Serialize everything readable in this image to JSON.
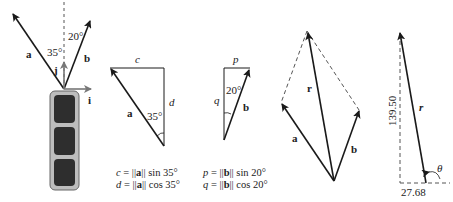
{
  "figure1": {
    "vector_a": "a",
    "vector_b": "b",
    "unit_i": "i",
    "unit_j": "j",
    "angle_a": "35°",
    "angle_b": "20°"
  },
  "figure2": {
    "side_top": "c",
    "side_right": "d",
    "hypotenuse": "a",
    "angle": "35°",
    "eq1_lhs": "c",
    "eq1_vec": "a",
    "eq1_fn": "sin 35°",
    "eq2_lhs": "d",
    "eq2_vec": "a",
    "eq2_fn": "cos 35°"
  },
  "figure3": {
    "side_top": "p",
    "side_left": "q",
    "hypotenuse": "b",
    "angle": "20°",
    "eq1_lhs": "p",
    "eq1_vec": "b",
    "eq1_fn": "sin 20°",
    "eq2_lhs": "q",
    "eq2_vec": "b",
    "eq2_fn": "cos 20°"
  },
  "figure4": {
    "vector_a": "a",
    "vector_b": "b",
    "resultant": "r"
  },
  "figure5": {
    "resultant": "r",
    "vertical_component": "139.50",
    "horizontal_component": "27.68",
    "angle": "θ"
  },
  "colors": {
    "line": "#1a1a1a",
    "dashed": "#555555",
    "arrow_unit": "#777777",
    "box_fill": "#bdbdbd",
    "cell_fill": "#2e2e2e"
  }
}
